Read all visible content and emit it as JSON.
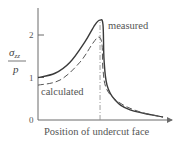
{
  "chart_data": {
    "type": "line",
    "title": "",
    "xlabel": "Position of undercut face",
    "ylabel": {
      "symbol": "σ",
      "subscript": "zz",
      "denominator": "p"
    },
    "xlim": [
      0,
      10
    ],
    "ylim": [
      0,
      2.6
    ],
    "yticks": [
      {
        "value": 0,
        "label": "0"
      },
      {
        "value": 1,
        "label": "1"
      },
      {
        "value": 2,
        "label": "2"
      }
    ],
    "grid": false,
    "marker_line": {
      "x": 4.63,
      "style": "dash-dot",
      "meaning": "undercut face"
    },
    "series": [
      {
        "name": "measured",
        "style": "solid",
        "color": "#3a3a3a",
        "x": [
          0,
          1.27,
          2.39,
          3.5,
          4.25,
          4.63,
          4.85,
          4.93,
          5.15,
          5.75,
          6.87,
          9.33
        ],
        "y": [
          1.0,
          1.1,
          1.36,
          1.84,
          2.24,
          2.35,
          2.24,
          1.41,
          0.82,
          0.47,
          0.24,
          0.07
        ]
      },
      {
        "name": "calculated",
        "style": "dashed",
        "color": "#555555",
        "x": [
          0,
          1.64,
          3.13,
          4.1,
          4.55,
          4.78,
          4.85,
          5.15,
          6.12,
          7.61,
          9.33
        ],
        "y": [
          0.82,
          0.94,
          1.36,
          1.81,
          1.95,
          1.76,
          1.18,
          0.71,
          0.4,
          0.19,
          0.07
        ]
      }
    ],
    "annotations": [
      {
        "text": "measured",
        "near_series": "measured",
        "placement": "right of peak"
      },
      {
        "text": "calculated",
        "near_series": "calculated",
        "placement": "below curve, left of peak"
      }
    ]
  }
}
